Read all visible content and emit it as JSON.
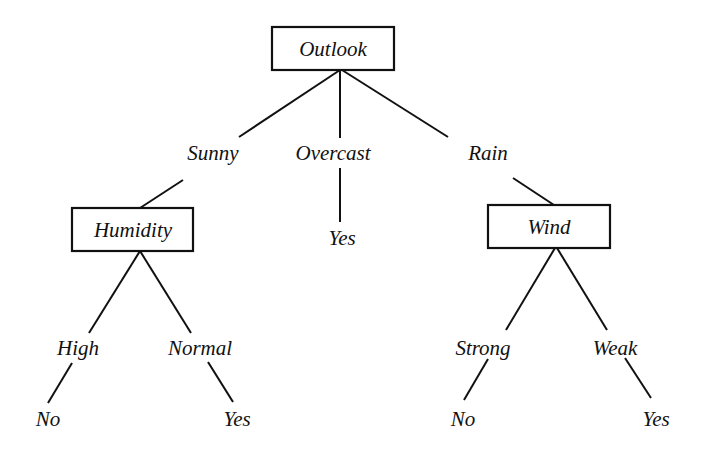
{
  "diagram": {
    "type": "decision-tree",
    "root": {
      "label": "Outlook",
      "branches": [
        {
          "label": "Sunny",
          "child": {
            "label": "Humidity",
            "branches": [
              {
                "label": "High",
                "leaf": "No"
              },
              {
                "label": "Normal",
                "leaf": "Yes"
              }
            ]
          }
        },
        {
          "label": "Overcast",
          "leaf": "Yes"
        },
        {
          "label": "Rain",
          "child": {
            "label": "Wind",
            "branches": [
              {
                "label": "Strong",
                "leaf": "No"
              },
              {
                "label": "Weak",
                "leaf": "Yes"
              }
            ]
          }
        }
      ]
    }
  },
  "nodes": {
    "outlook": "Outlook",
    "humidity": "Humidity",
    "wind": "Wind"
  },
  "edges": {
    "sunny": "Sunny",
    "overcast": "Overcast",
    "rain": "Rain",
    "high": "High",
    "normal": "Normal",
    "strong": "Strong",
    "weak": "Weak"
  },
  "leaves": {
    "overcast_yes": "Yes",
    "high_no": "No",
    "normal_yes": "Yes",
    "strong_no": "No",
    "weak_yes": "Yes"
  }
}
